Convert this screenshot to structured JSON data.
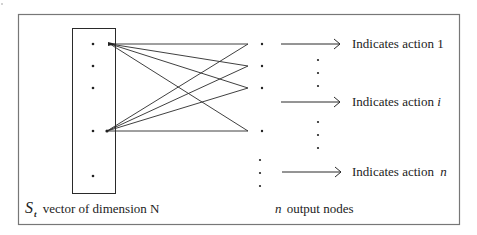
{
  "diagram": {
    "input": {
      "symbol": "S",
      "subscript": "t",
      "caption": "vector of dimension N",
      "dots_visible": 5
    },
    "outputs": {
      "symbol": "n",
      "caption": "output nodes"
    },
    "actions": [
      {
        "prefix": "Indicates action",
        "index": "1",
        "italic": false
      },
      {
        "prefix": "Indicates action",
        "index": "i",
        "italic": true
      },
      {
        "prefix": "Indicates action",
        "index": "n",
        "italic": true
      }
    ],
    "colors": {
      "line": "#2a2a2a",
      "border": "#666666",
      "text": "#222222",
      "background": "#ffffff"
    }
  }
}
